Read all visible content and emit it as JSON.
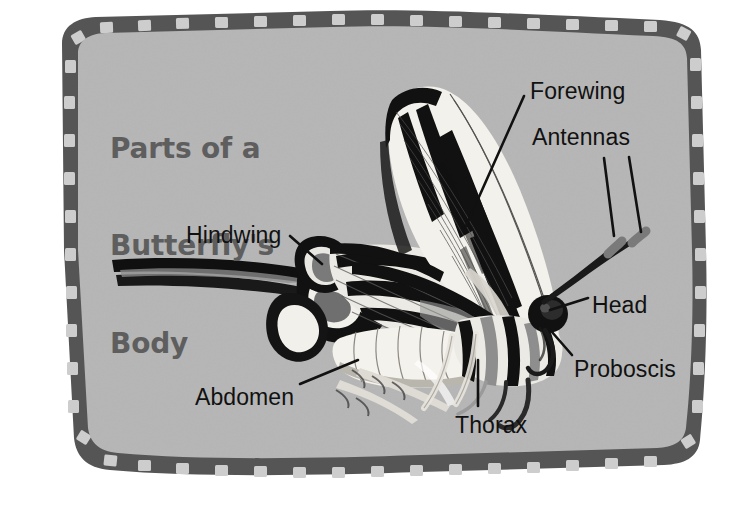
{
  "poster": {
    "title_line1": "Parts of a",
    "title_line2": "Butterfly's",
    "title_line3": "Body",
    "subject": "zebra-swallowtail-butterfly",
    "colors": {
      "page_background": "#ffffff",
      "panel_background": "#b6b6b6",
      "border_band": "#555555",
      "border_dash": "#cfcfcf",
      "title_text": "#5e5e5e",
      "label_text": "#111111",
      "wing_light": "#f2f0ea",
      "wing_dark": "#111111",
      "body_mid": "#9a9a9a"
    }
  },
  "labels": [
    {
      "id": "forewing",
      "text": "Forewing",
      "x": 530,
      "y": 80,
      "anchor": "left"
    },
    {
      "id": "antennas",
      "text": "Antennas",
      "x": 532,
      "y": 126,
      "anchor": "left"
    },
    {
      "id": "hindwing",
      "text": "Hindwing",
      "x": 186,
      "y": 224,
      "anchor": "left"
    },
    {
      "id": "head",
      "text": "Head",
      "x": 592,
      "y": 294,
      "anchor": "left"
    },
    {
      "id": "proboscis",
      "text": "Proboscis",
      "x": 574,
      "y": 358,
      "anchor": "left"
    },
    {
      "id": "abdomen",
      "text": "Abdomen",
      "x": 195,
      "y": 386,
      "anchor": "left"
    },
    {
      "id": "thorax",
      "text": "Thorax",
      "x": 455,
      "y": 414,
      "anchor": "left"
    }
  ],
  "leader_lines": [
    {
      "id": "forewing-leader",
      "from": [
        524,
        96
      ],
      "to": [
        466,
        226
      ]
    },
    {
      "id": "antenna-leader-1",
      "from": [
        604,
        158
      ],
      "to": [
        614,
        236
      ]
    },
    {
      "id": "antenna-leader-2",
      "from": [
        629,
        157
      ],
      "to": [
        640,
        232
      ]
    },
    {
      "id": "hindwing-leader",
      "from": [
        288,
        237
      ],
      "to": [
        320,
        262
      ]
    },
    {
      "id": "head-leader",
      "from": [
        588,
        298
      ],
      "to": [
        551,
        310
      ]
    },
    {
      "id": "proboscis-leader",
      "from": [
        570,
        357
      ],
      "to": [
        545,
        325
      ]
    },
    {
      "id": "abdomen-leader",
      "from": [
        298,
        385
      ],
      "to": [
        355,
        362
      ]
    },
    {
      "id": "thorax-leader",
      "from": [
        478,
        404
      ],
      "to": [
        478,
        362
      ]
    }
  ]
}
